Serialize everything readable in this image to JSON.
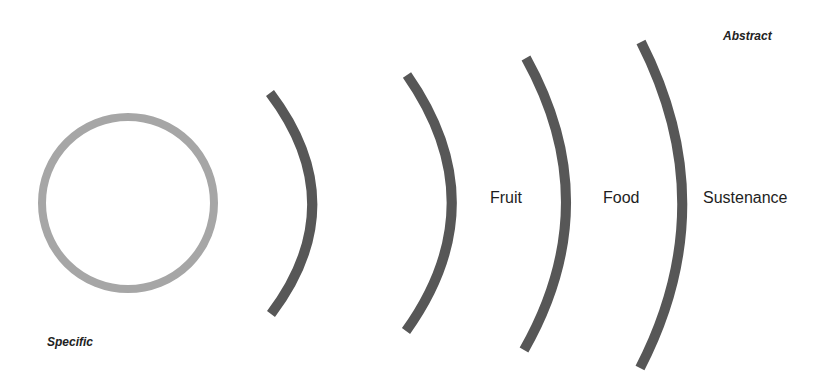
{
  "diagram": {
    "type": "abstraction-ladder",
    "colors": {
      "circle_stroke": "#a6a6a6",
      "arc_stroke": "#575757",
      "text": "#1e1e1e",
      "background": "#ffffff"
    },
    "axis_labels": {
      "specific": "Specific",
      "abstract": "Abstract"
    },
    "level_labels": {
      "fruit": "Fruit",
      "food": "Food",
      "sustenance": "Sustenance"
    },
    "shapes": {
      "circle": {
        "cx": 128,
        "cy": 203,
        "r": 86
      },
      "arcs": [
        {
          "top": [
            270,
            93
          ],
          "mid": [
            326,
            204
          ],
          "bottom": [
            271,
            314
          ]
        },
        {
          "top": [
            407,
            75
          ],
          "mid": [
            452,
            204
          ],
          "bottom": [
            406,
            331
          ]
        },
        {
          "top": [
            526,
            58
          ],
          "mid": [
            566,
            204
          ],
          "bottom": [
            524,
            350
          ]
        },
        {
          "top": [
            641,
            42
          ],
          "mid": [
            682,
            205
          ],
          "bottom": [
            640,
            368
          ]
        }
      ]
    }
  }
}
